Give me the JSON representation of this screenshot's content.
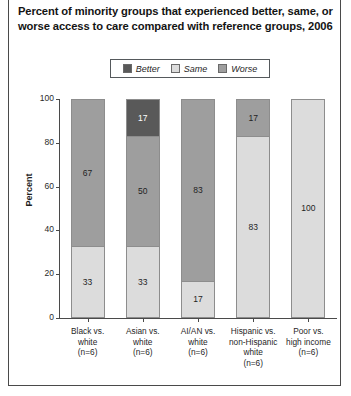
{
  "title": "Percent of minority groups that experienced better, same, or worse access to care compared with reference groups, 2006",
  "legend": {
    "items": [
      {
        "label": "Better",
        "color": "#595959",
        "icon": "legend-swatch-better"
      },
      {
        "label": "Same",
        "color": "#dcdcdc",
        "icon": "legend-swatch-same"
      },
      {
        "label": "Worse",
        "color": "#9e9e9e",
        "icon": "legend-swatch-worse"
      }
    ]
  },
  "chart_data": {
    "type": "bar",
    "title": "Percent of minority groups that experienced better, same, or worse access to care compared with reference groups, 2006",
    "xlabel": "",
    "ylabel": "Percent",
    "ylim": [
      0,
      100
    ],
    "yticks": [
      0,
      20,
      40,
      60,
      80,
      100
    ],
    "grid": false,
    "stacked": true,
    "legend_position": "top-center",
    "categories": [
      "Black vs. white (n=6)",
      "Asian vs. white (n=6)",
      "AI/AN vs. white (n=6)",
      "Hispanic vs. non-Hispanic white (n=6)",
      "Poor vs. high income (n=6)"
    ],
    "category_lines": [
      [
        "Black vs.",
        "white",
        "(n=6)"
      ],
      [
        "Asian vs.",
        "white",
        "(n=6)"
      ],
      [
        "AI/AN vs.",
        "white",
        "(n=6)"
      ],
      [
        "Hispanic vs.",
        "non-Hispanic",
        "white",
        "(n=6)"
      ],
      [
        "Poor vs.",
        "high income",
        "(n=6)"
      ]
    ],
    "series": [
      {
        "name": "Same",
        "color": "#dcdcdc",
        "values": [
          33,
          33,
          17,
          83,
          100
        ]
      },
      {
        "name": "Worse",
        "color": "#9e9e9e",
        "values": [
          67,
          50,
          83,
          17,
          0
        ]
      },
      {
        "name": "Better",
        "color": "#595959",
        "values": [
          0,
          17,
          0,
          0,
          0
        ]
      }
    ]
  }
}
